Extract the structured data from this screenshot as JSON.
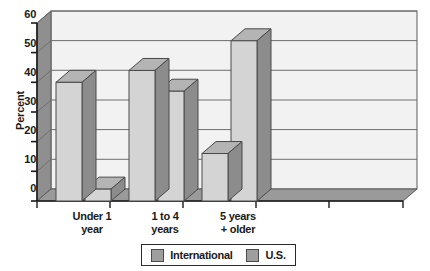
{
  "chart_data": {
    "type": "bar",
    "title": "",
    "subtitle": "",
    "xlabel": "",
    "ylabel": "Percent",
    "ylim": [
      0,
      60
    ],
    "ytick_values": [
      0,
      10,
      20,
      30,
      40,
      50,
      60
    ],
    "ytick_labels": [
      "0",
      "10",
      "20",
      "30",
      "40",
      "50",
      "60"
    ],
    "grid": true,
    "three_d": true,
    "legend_position": "bottom-center",
    "categories": [
      "Under 1 year",
      "1 to 4 years",
      "5 years + older"
    ],
    "category_lines": [
      [
        "Under 1",
        "year"
      ],
      [
        "1 to 4",
        "years"
      ],
      [
        "5 years",
        "+ older"
      ]
    ],
    "series": [
      {
        "name": "International",
        "color": "#d4d4d4",
        "side_color": "#8c8c8c",
        "top_color": "#b4b4b4",
        "values": [
          40,
          44,
          16
        ]
      },
      {
        "name": "U.S.",
        "color": "#d4d4d4",
        "side_color": "#8c8c8c",
        "top_color": "#b4b4b4",
        "values": [
          4,
          37,
          54
        ]
      }
    ],
    "colors": {
      "plot_background": "#f2f2f2",
      "wall_shade": "#8f8f8f",
      "floor_shade": "#9a9a9a",
      "gridline": "#6e6e6e",
      "axis": "#1a1a1a",
      "text": "#1a1a1a"
    }
  },
  "legend": {
    "items": [
      {
        "label": "International",
        "swatch_color": "#9e9e9e"
      },
      {
        "label": "U.S.",
        "swatch_color": "#9e9e9e"
      }
    ]
  }
}
